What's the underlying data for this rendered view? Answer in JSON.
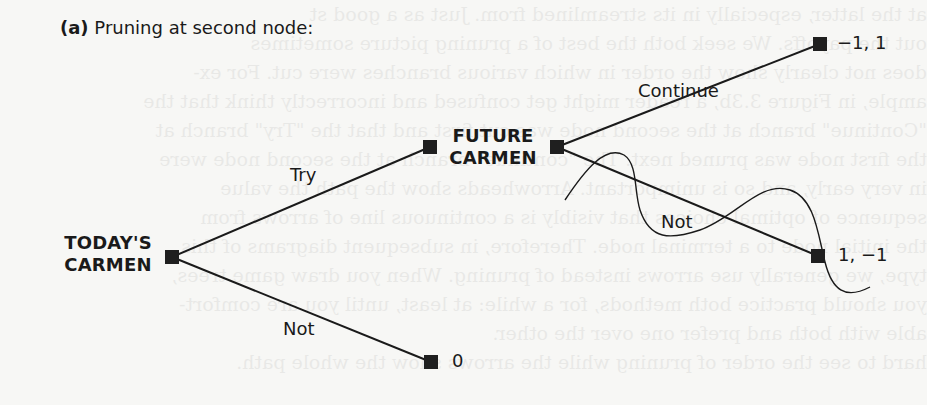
{
  "caption": {
    "prefix": "(a)",
    "text": "Pruning at second node:"
  },
  "nodes": {
    "root": {
      "label_line1": "TODAY'S",
      "label_line2": "CARMEN"
    },
    "second": {
      "label_line1": "FUTURE",
      "label_line2": "CARMEN"
    }
  },
  "branches": {
    "root_try": "Try",
    "root_not": "Not",
    "second_continue": "Continue",
    "second_not": "Not"
  },
  "payoffs": {
    "continue": "−1, 1",
    "not_second": "1, −1",
    "not_root": "0"
  },
  "annotations": {
    "pruned_branch": "second_not",
    "prune_mark": "wavy-line"
  },
  "colors": {
    "ink": "#1a1a1a",
    "node_fill": "#1f1f1f",
    "paper": "#f7f7f5"
  }
}
